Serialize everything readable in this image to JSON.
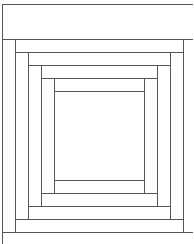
{
  "colors": {
    "background": "#ffffff",
    "line": "#555555"
  },
  "pattern": {
    "type": "log-cabin",
    "rings": 4,
    "center": "square"
  }
}
